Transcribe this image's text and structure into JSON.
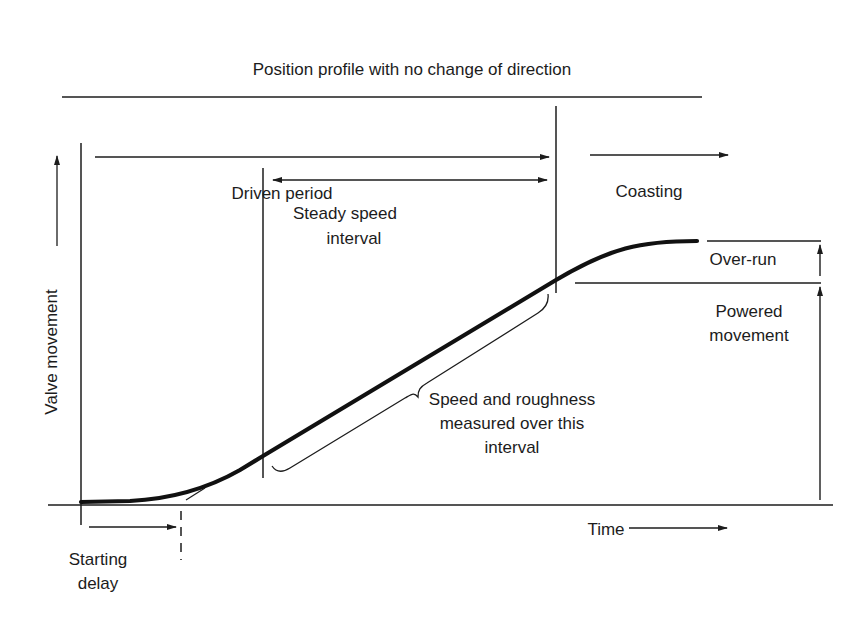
{
  "diagram": {
    "title": "Position profile with no change of direction",
    "y_axis_label": "Valve movement",
    "x_axis_label": "Time",
    "phases": {
      "driven_period": "Driven period",
      "coasting": "Coasting",
      "steady_speed_line1": "Steady speed",
      "steady_speed_line2": "interval",
      "starting_delay_line1": "Starting",
      "starting_delay_line2": "delay"
    },
    "annotations": {
      "measurement_line1": "Speed and roughness",
      "measurement_line2": "measured over this",
      "measurement_line3": "interval",
      "over_run": "Over-run",
      "powered_line1": "Powered",
      "powered_line2": "movement"
    },
    "colors": {
      "ink": "#1c1c1c",
      "background": "#ffffff"
    }
  }
}
